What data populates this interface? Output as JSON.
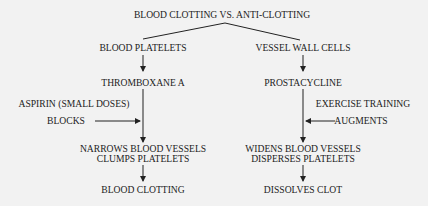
{
  "title": "BLOOD CLOTTING VS. ANTI-CLOTTING",
  "left_branch": {
    "source": "BLOOD PLATELETS",
    "substance": "THROMBOXANE A",
    "modifier": {
      "line1": "ASPIRIN (SMALL DOSES)",
      "line2": "BLOCKS"
    },
    "effect": {
      "line1": "NARROWS BLOOD VESSELS",
      "line2": "CLUMPS PLATELETS"
    },
    "outcome": "BLOOD CLOTTING"
  },
  "right_branch": {
    "source": "VESSEL WALL CELLS",
    "substance": "PROSTACYCLINE",
    "modifier": {
      "line1": "EXERCISE TRAINING",
      "line2": "AUGMENTS"
    },
    "effect": {
      "line1": "WIDENS BLOOD VESSELS",
      "line2": "DISPERSES PLATELETS"
    },
    "outcome": "DISSOLVES CLOT"
  },
  "colors": {
    "background": "#f2f2f2",
    "ink": "#222222"
  }
}
